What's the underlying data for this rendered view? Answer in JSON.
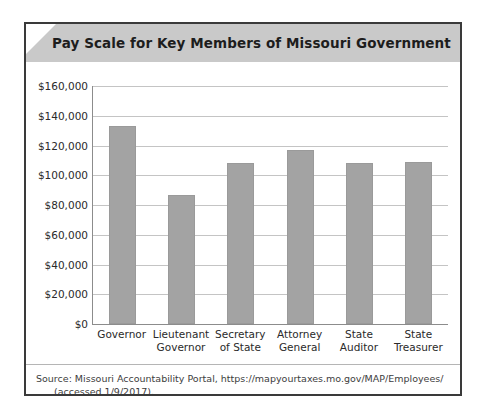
{
  "figure": {
    "title": "Pay Scale for Key Members of Missouri Government",
    "source_line1": "Source: Missouri Accountability Portal, https://mapyourtaxes.mo.gov/MAP/Employees/",
    "source_line2": "(accessed 1/9/2017)."
  },
  "colors": {
    "bar_fill": "#a3a3a3",
    "title_band": "#c9c9c9",
    "frame": "#3a3a3a",
    "gridline": "#c4c4c4",
    "axis": "#8c8c8c"
  },
  "chart_data": {
    "type": "bar",
    "title": "Pay Scale for Key Members of Missouri Government",
    "xlabel": "",
    "ylabel": "",
    "categories": [
      "Governor",
      "Lieutenant Governor",
      "Secretary of State",
      "Attorney General",
      "State Auditor",
      "State Treasurer"
    ],
    "category_lines": [
      [
        "Governor",
        ""
      ],
      [
        "Lieutenant",
        "Governor"
      ],
      [
        "Secretary",
        "of State"
      ],
      [
        "Attorney",
        "General"
      ],
      [
        "State",
        "Auditor"
      ],
      [
        "State",
        "Treasurer"
      ]
    ],
    "values": [
      133000,
      87000,
      108000,
      117000,
      108000,
      109000
    ],
    "ylim": [
      0,
      160000
    ],
    "ytick_values": [
      0,
      20000,
      40000,
      60000,
      80000,
      100000,
      120000,
      140000,
      160000
    ],
    "ytick_labels": [
      "$0",
      "$20,000",
      "$40,000",
      "$60,000",
      "$80,000",
      "$100,000",
      "$120,000",
      "$140,000",
      "$160,000"
    ],
    "grid": true,
    "legend": false
  }
}
